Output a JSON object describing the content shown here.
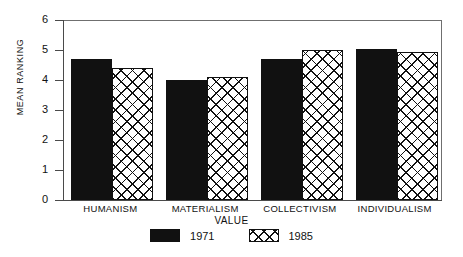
{
  "chart_data": {
    "type": "bar",
    "title": "",
    "xlabel": "VALUE",
    "ylabel": "MEAN RANKING",
    "categories": [
      "HUMANISM",
      "MATERIALISM",
      "COLLECTIVISM",
      "INDIVIDUALISM"
    ],
    "series": [
      {
        "name": "1971",
        "values": [
          4.7,
          4.0,
          4.7,
          5.05
        ],
        "fill": "solid",
        "color": "#111111"
      },
      {
        "name": "1985",
        "values": [
          4.4,
          4.1,
          5.0,
          4.95
        ],
        "fill": "crosshatch",
        "color": "#111111"
      }
    ],
    "ylim": [
      0,
      6
    ],
    "yticks": [
      0,
      1,
      2,
      3,
      4,
      5,
      6
    ],
    "ytick_labels": [
      "0",
      "1",
      "2",
      "3",
      "4",
      "5",
      "6"
    ],
    "grid": false,
    "legend_position": "bottom-center",
    "frame": "top-right-open-box"
  },
  "legend": {
    "entries": [
      {
        "label": "1971",
        "swatch": "solid"
      },
      {
        "label": "1985",
        "swatch": "crosshatch"
      }
    ]
  }
}
